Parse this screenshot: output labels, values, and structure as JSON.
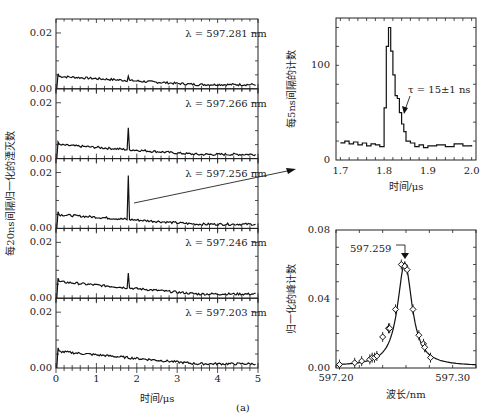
{
  "caption": "(a)",
  "chart_data": [
    {
      "type": "line",
      "title": "Stacked decay spectra at five wavelengths",
      "xlabel": "时间/μs",
      "ylabel": "每20ns间隔归一化的湮灭数",
      "xlim": [
        0,
        5
      ],
      "xticks": [
        "0",
        "1",
        "2",
        "3",
        "4",
        "5"
      ],
      "ylim": [
        0,
        0.025
      ],
      "yticks": [
        "0.00",
        "0.02"
      ],
      "series": [
        {
          "name": "λ = 597.281 nm",
          "peak_at_us": 1.8,
          "peak_height": 0.0045,
          "baseline_start": 0.0045,
          "baseline_end": 0.0015
        },
        {
          "name": "λ = 597.266 nm",
          "peak_at_us": 1.8,
          "peak_height": 0.011,
          "baseline_start": 0.005,
          "baseline_end": 0.0015
        },
        {
          "name": "λ = 597.256 nm",
          "peak_at_us": 1.8,
          "peak_height": 0.019,
          "baseline_start": 0.005,
          "baseline_end": 0.0015
        },
        {
          "name": "λ = 597.246 nm",
          "peak_at_us": 1.8,
          "peak_height": 0.009,
          "baseline_start": 0.006,
          "baseline_end": 0.0015
        },
        {
          "name": "λ = 597.203 nm",
          "peak_at_us": null,
          "peak_height": null,
          "baseline_start": 0.006,
          "baseline_end": 0.0015
        }
      ]
    },
    {
      "type": "line",
      "title": "Zoomed peak (597.256 nm)",
      "xlabel": "时间/μs",
      "ylabel": "每5ns间隔的计数",
      "xlim": [
        1.69,
        2.01
      ],
      "xticks": [
        "1.7",
        "1.8",
        "1.9",
        "2.0"
      ],
      "ylim": [
        0,
        150
      ],
      "yticks": [
        "0",
        "100"
      ],
      "annotation": "τ = 15±1 ns",
      "x": [
        1.7,
        1.71,
        1.72,
        1.73,
        1.74,
        1.75,
        1.76,
        1.77,
        1.78,
        1.79,
        1.8,
        1.805,
        1.81,
        1.815,
        1.82,
        1.825,
        1.83,
        1.835,
        1.84,
        1.845,
        1.85,
        1.86,
        1.87,
        1.88,
        1.89,
        1.9,
        1.92,
        1.94,
        1.96,
        1.98,
        2.0
      ],
      "values": [
        18,
        20,
        17,
        19,
        16,
        18,
        15,
        17,
        16,
        14,
        55,
        120,
        140,
        115,
        90,
        68,
        65,
        50,
        38,
        30,
        20,
        18,
        14,
        16,
        13,
        15,
        16,
        14,
        17,
        15,
        16
      ]
    },
    {
      "type": "scatter",
      "title": "Resonance line profile",
      "xlabel": "波长/nm",
      "ylabel": "归一化的峰计数",
      "xlim": [
        597.2,
        597.32
      ],
      "xticks": [
        "597.20",
        "597.30"
      ],
      "ylim": [
        0,
        0.08
      ],
      "yticks": [
        "0.00",
        "0.04",
        "0.08"
      ],
      "annotation": "597.259",
      "x": [
        597.203,
        597.216,
        597.222,
        597.229,
        597.231,
        597.233,
        597.235,
        597.24,
        597.245,
        597.246,
        597.251,
        597.256,
        597.259,
        597.261,
        597.266,
        597.271,
        597.275,
        597.276,
        597.281
      ],
      "values": [
        0.002,
        0.003,
        0.004,
        0.005,
        0.006,
        0.006,
        0.007,
        0.018,
        0.023,
        0.023,
        0.034,
        0.06,
        0.059,
        0.057,
        0.034,
        0.019,
        0.014,
        0.012,
        0.006
      ],
      "fit": "Lorentzian, center 597.259, peak ≈0.06"
    }
  ]
}
